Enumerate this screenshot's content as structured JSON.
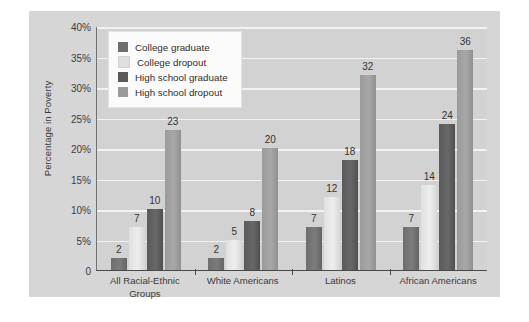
{
  "chart_data": {
    "type": "bar",
    "title": "",
    "xlabel": "",
    "ylabel": "Percentage in Poverty",
    "ylim": [
      0,
      40
    ],
    "grid": true,
    "legend_position": "top-left",
    "categories": [
      "All Racial-Ethnic Groups",
      "White Americans",
      "Latinos",
      "African Americans"
    ],
    "ytick_labels": [
      "40%",
      "35%",
      "30%",
      "25%",
      "20%",
      "15%",
      "10%",
      "5%",
      "0"
    ],
    "ytick_values": [
      40,
      35,
      30,
      25,
      20,
      15,
      10,
      5,
      0
    ],
    "series": [
      {
        "name": "College graduate",
        "color": "#6e6e6e",
        "values": [
          2,
          2,
          7,
          7
        ]
      },
      {
        "name": "College dropout",
        "color": "#e0e0e0",
        "values": [
          7,
          5,
          12,
          14
        ]
      },
      {
        "name": "High school graduate",
        "color": "#5a5a5a",
        "values": [
          10,
          8,
          18,
          24
        ]
      },
      {
        "name": "High school dropout",
        "color": "#9a9a9a",
        "values": [
          23,
          20,
          32,
          36
        ]
      }
    ]
  }
}
